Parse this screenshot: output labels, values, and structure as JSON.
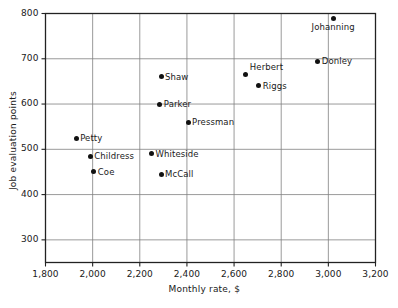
{
  "chart_data": {
    "type": "scatter",
    "title": "",
    "xlabel": "Monthly rate, $",
    "ylabel": "Job evaluation points",
    "xlim": [
      1800,
      3200
    ],
    "ylim": [
      250,
      800
    ],
    "grid": true,
    "legend": "none",
    "xticks": [
      "1,800",
      "2,000",
      "2,200",
      "2,400",
      "2,600",
      "2,800",
      "3,000",
      "3,200"
    ],
    "xtick_values": [
      1800,
      2000,
      2200,
      2400,
      2600,
      2800,
      3000,
      3200
    ],
    "yticks": [
      "300",
      "400",
      "500",
      "600",
      "700",
      "800"
    ],
    "ytick_values": [
      300,
      400,
      500,
      600,
      700,
      800
    ],
    "points": [
      {
        "label": "Johanning",
        "x": 3020,
        "y": 790,
        "label_pos": "below"
      },
      {
        "label": "Donley",
        "x": 2955,
        "y": 695,
        "label_pos": "right"
      },
      {
        "label": "Herbert",
        "x": 2650,
        "y": 665,
        "label_pos": "above-right"
      },
      {
        "label": "Shaw",
        "x": 2290,
        "y": 660,
        "label_pos": "right"
      },
      {
        "label": "Riggs",
        "x": 2705,
        "y": 640,
        "label_pos": "right"
      },
      {
        "label": "Parker",
        "x": 2285,
        "y": 600,
        "label_pos": "right"
      },
      {
        "label": "Pressman",
        "x": 2405,
        "y": 560,
        "label_pos": "right"
      },
      {
        "label": "Petty",
        "x": 1930,
        "y": 525,
        "label_pos": "right"
      },
      {
        "label": "Whiteside",
        "x": 2250,
        "y": 490,
        "label_pos": "right"
      },
      {
        "label": "Childress",
        "x": 1990,
        "y": 485,
        "label_pos": "right"
      },
      {
        "label": "Coe",
        "x": 2005,
        "y": 450,
        "label_pos": "right"
      },
      {
        "label": "McCall",
        "x": 2290,
        "y": 445,
        "label_pos": "right"
      }
    ]
  }
}
